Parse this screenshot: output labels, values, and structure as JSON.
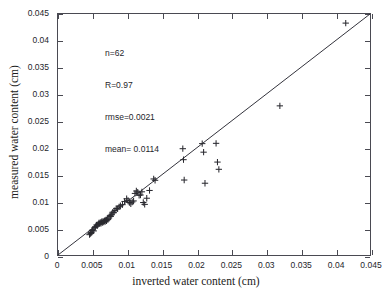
{
  "chart_data": {
    "type": "scatter",
    "title": "",
    "xlabel": "inverted water content (cm)",
    "ylabel": "measured water content (cm)",
    "xlim": [
      0,
      0.045
    ],
    "ylim": [
      0,
      0.045
    ],
    "grid": false,
    "legend": null,
    "xticks": [
      0,
      0.005,
      0.01,
      0.015,
      0.02,
      0.025,
      0.03,
      0.035,
      0.04,
      0.045
    ],
    "yticks": [
      0,
      0.005,
      0.01,
      0.015,
      0.02,
      0.025,
      0.03,
      0.035,
      0.04,
      0.045
    ],
    "xticklabels": [
      "0",
      "0.005",
      "0.01",
      "0.015",
      "0.02",
      "0.025",
      "0.03",
      "0.035",
      "0.04",
      "0.045"
    ],
    "yticklabels": [
      "0",
      "0.005",
      "0.01",
      "0.015",
      "0.02",
      "0.025",
      "0.03",
      "0.035",
      "0.04",
      "0.045"
    ],
    "marker": "+",
    "marker_color": "#2a2a30",
    "reference_line": {
      "type": "identity",
      "from": [
        0,
        0
      ],
      "to": [
        0.045,
        0.045
      ],
      "color": "#31313a"
    },
    "annotations": [
      "n=62",
      "R=0.97",
      "rmse=0.0021",
      "mean= 0.0114"
    ],
    "series": [
      {
        "name": "measured vs inverted water content",
        "x": [
          0.00455,
          0.0047,
          0.0048,
          0.0049,
          0.005,
          0.00515,
          0.0053,
          0.0054,
          0.00555,
          0.00565,
          0.0058,
          0.0059,
          0.006,
          0.0061,
          0.0062,
          0.0063,
          0.0064,
          0.0065,
          0.0066,
          0.0067,
          0.0068,
          0.0069,
          0.007,
          0.0071,
          0.0072,
          0.00735,
          0.0075,
          0.0076,
          0.00775,
          0.0079,
          0.00805,
          0.0082,
          0.0084,
          0.0086,
          0.0088,
          0.009,
          0.0093,
          0.0096,
          0.0099,
          0.0101,
          0.0103,
          0.0105,
          0.0107,
          0.0109,
          0.0111,
          0.0113,
          0.0115,
          0.0117,
          0.0119,
          0.0121,
          0.0123,
          0.0125,
          0.0128,
          0.0132,
          0.0138,
          0.014,
          0.018,
          0.0181,
          0.0182,
          0.0208,
          0.021,
          0.0212,
          0.0228,
          0.023,
          0.0232,
          0.032,
          0.0415
        ],
        "y": [
          0.0038,
          0.004,
          0.0042,
          0.00455,
          0.0047,
          0.0045,
          0.0051,
          0.0053,
          0.0056,
          0.00545,
          0.00575,
          0.006,
          0.00585,
          0.0061,
          0.0059,
          0.0062,
          0.00605,
          0.0063,
          0.00615,
          0.0064,
          0.00625,
          0.00655,
          0.0064,
          0.0067,
          0.0066,
          0.0069,
          0.0074,
          0.0072,
          0.0076,
          0.008,
          0.0079,
          0.0083,
          0.0087,
          0.0086,
          0.009,
          0.0092,
          0.0094,
          0.01,
          0.0105,
          0.0102,
          0.0098,
          0.00955,
          0.0099,
          0.0101,
          0.0115,
          0.01195,
          0.01175,
          0.01115,
          0.0112,
          0.0118,
          0.0098,
          0.00945,
          0.0106,
          0.01205,
          0.0142,
          0.01395,
          0.01985,
          0.0178,
          0.014,
          0.0208,
          0.0192,
          0.0134,
          0.02085,
          0.01735,
          0.016,
          0.02785,
          0.0433
        ]
      }
    ]
  },
  "axes": {
    "x_title": "inverted water content (cm)",
    "y_title": "measured water content (cm)"
  }
}
